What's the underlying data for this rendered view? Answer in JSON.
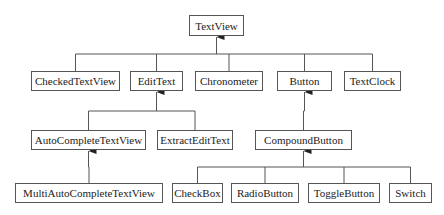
{
  "diagram": {
    "nodes": [
      {
        "id": "textview",
        "label": "TextView",
        "x": 189,
        "y": 15,
        "w": 55,
        "h": 21
      },
      {
        "id": "checkedtextview",
        "label": "CheckedTextView",
        "x": 31,
        "y": 71,
        "w": 89,
        "h": 20
      },
      {
        "id": "edittext",
        "label": "EditText",
        "x": 130,
        "y": 71,
        "w": 53,
        "h": 20
      },
      {
        "id": "chronometer",
        "label": "Chronometer",
        "x": 195,
        "y": 71,
        "w": 68,
        "h": 20
      },
      {
        "id": "button",
        "label": "Button",
        "x": 277,
        "y": 71,
        "w": 55,
        "h": 20
      },
      {
        "id": "textclock",
        "label": "TextClock",
        "x": 344,
        "y": 71,
        "w": 57,
        "h": 20
      },
      {
        "id": "autocompletetextview",
        "label": "AutoCompleteTextView",
        "x": 31,
        "y": 130,
        "w": 115,
        "h": 20
      },
      {
        "id": "extractedittext",
        "label": "ExtractEditText",
        "x": 157,
        "y": 130,
        "w": 76,
        "h": 20
      },
      {
        "id": "compoundbutton",
        "label": "CompoundButton",
        "x": 255,
        "y": 130,
        "w": 97,
        "h": 20
      },
      {
        "id": "multiautocompletetextview",
        "label": "MultiAutoCompleteTextView",
        "x": 15,
        "y": 183,
        "w": 148,
        "h": 20
      },
      {
        "id": "checkbox",
        "label": "CheckBox",
        "x": 172,
        "y": 183,
        "w": 51,
        "h": 20
      },
      {
        "id": "radiobutton",
        "label": "RadioButton",
        "x": 231,
        "y": 183,
        "w": 68,
        "h": 20
      },
      {
        "id": "togglebutton",
        "label": "ToggleButton",
        "x": 308,
        "y": 183,
        "w": 72,
        "h": 20
      },
      {
        "id": "switch",
        "label": "Switch",
        "x": 389,
        "y": 183,
        "w": 43,
        "h": 20
      }
    ],
    "edges": [
      {
        "parent": "textview",
        "children": [
          "checkedtextview",
          "edittext",
          "chronometer",
          "button",
          "textclock"
        ]
      },
      {
        "parent": "edittext",
        "children": [
          "autocompletetextview",
          "extractedittext"
        ]
      },
      {
        "parent": "button",
        "children": [
          "compoundbutton"
        ]
      },
      {
        "parent": "autocompletetextview",
        "children": [
          "multiautocompletetextview"
        ]
      },
      {
        "parent": "compoundbutton",
        "children": [
          "checkbox",
          "radiobutton",
          "togglebutton",
          "switch"
        ]
      }
    ],
    "colors": {
      "line": "#555555",
      "box_border": "#555555",
      "text": "#222222"
    }
  }
}
